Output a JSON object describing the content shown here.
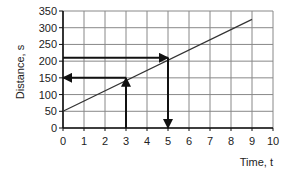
{
  "chart_data": {
    "type": "line",
    "title": "",
    "xlabel": "Time, t",
    "ylabel": "Distance, s",
    "xlim": [
      0,
      10
    ],
    "ylim": [
      0,
      350
    ],
    "xticks": [
      0,
      1,
      2,
      3,
      4,
      5,
      6,
      7,
      8,
      9,
      10
    ],
    "yticks": [
      0,
      50,
      100,
      150,
      200,
      250,
      300,
      350
    ],
    "grid": true,
    "series": [
      {
        "name": "distance",
        "x": [
          0,
          9
        ],
        "y": [
          50,
          325
        ]
      }
    ],
    "annotations": [
      {
        "type": "arrow",
        "from": [
          3,
          0
        ],
        "to": [
          3,
          150
        ],
        "label": "read up at t=3"
      },
      {
        "type": "arrow",
        "from": [
          3,
          150
        ],
        "to": [
          0,
          150
        ],
        "label": "s = 150"
      },
      {
        "type": "arrow",
        "from": [
          0,
          210
        ],
        "to": [
          5,
          210
        ],
        "label": "s = 210"
      },
      {
        "type": "arrow",
        "from": [
          5,
          210
        ],
        "to": [
          5,
          0
        ],
        "label": "t = 5"
      }
    ],
    "legend": null
  }
}
